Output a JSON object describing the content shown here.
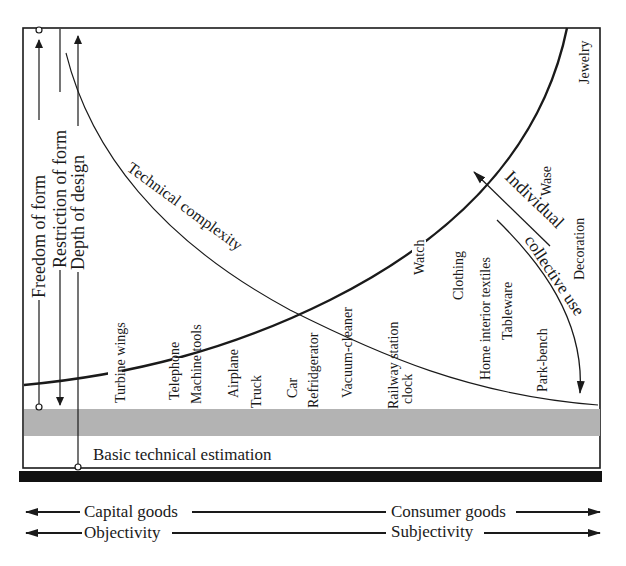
{
  "diagram": {
    "axes_left": {
      "freedom_of_form": "Freedom of form",
      "restriction_of_form": "Restriction of form",
      "depth_of_design": "Depth of design"
    },
    "curves": {
      "technical_complexity": "Technical complexity",
      "individual": "Individual",
      "collective_use": "collective use"
    },
    "products": {
      "turbine_wings": "Turbine wings",
      "telephone": "Telephone",
      "machine_tools": "Machine tools",
      "airplane": "Airplane",
      "truck": "Truck",
      "car": "Car",
      "refridgerator": "Refridgerator",
      "vacuum_cleaner": "Vacuum-cleaner",
      "railway_station": "Railway station",
      "clock": "clock",
      "watch": "Watch",
      "clothing": "Clothing",
      "home_interior_textiles": "Home interior textiles",
      "tableware": "Tableware",
      "park_bench": "Park-bench",
      "decoration": "Decoration",
      "wase": "Wase",
      "jewelry": "Jewelry"
    },
    "base_label": "Basic technical estimation",
    "bottom_axes": {
      "capital_goods": "Capital goods",
      "consumer_goods": "Consumer goods",
      "objectivity": "Objectivity",
      "subjectivity": "Subjectivity"
    },
    "colors": {
      "line": "#1a1a1a",
      "band": "#b3b3b3",
      "base_bar": "#111111"
    }
  }
}
